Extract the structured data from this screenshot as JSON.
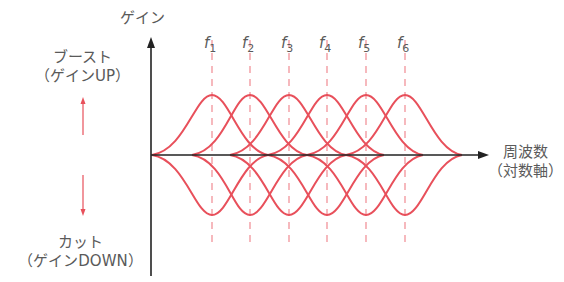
{
  "diagram": {
    "y_axis_label": "ゲイン",
    "x_axis_label_line1": "周波数",
    "x_axis_label_line2": "（対数軸）",
    "boost_label_line1": "ブースト",
    "boost_label_line2": "（ゲインUP）",
    "cut_label_line1": "カット",
    "cut_label_line2": "（ゲインDOWN）",
    "frequencies": [
      {
        "name": "f",
        "sub": "1"
      },
      {
        "name": "f",
        "sub": "2"
      },
      {
        "name": "f",
        "sub": "3"
      },
      {
        "name": "f",
        "sub": "4"
      },
      {
        "name": "f",
        "sub": "5"
      },
      {
        "name": "f",
        "sub": "6"
      }
    ],
    "colors": {
      "curve": "#e8505b",
      "dashed": "#f08a92",
      "axis": "#222222",
      "text": "#5a5a5a"
    }
  }
}
